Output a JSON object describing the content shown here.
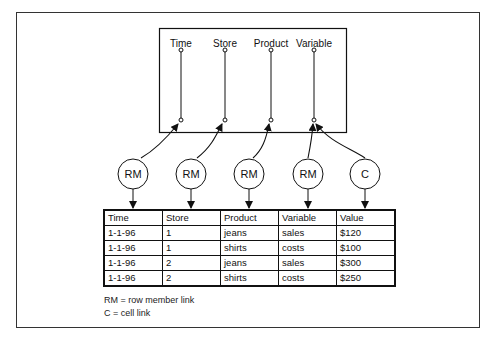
{
  "diagram": {
    "dimensions": [
      "Time",
      "Store",
      "Product",
      "Variable"
    ],
    "links": [
      {
        "label": "RM",
        "target_dimension": "Time",
        "target_column": "Time"
      },
      {
        "label": "RM",
        "target_dimension": "Store",
        "target_column": "Store"
      },
      {
        "label": "RM",
        "target_dimension": "Product",
        "target_column": "Product"
      },
      {
        "label": "RM",
        "target_dimension": "Variable",
        "target_column": "Variable"
      },
      {
        "label": "C",
        "target_dimension": "Variable",
        "target_column": "Value"
      }
    ],
    "table": {
      "headers": [
        "Time",
        "Store",
        "Product",
        "Variable",
        "Value"
      ],
      "rows": [
        [
          "1-1-96",
          "1",
          "jeans",
          "sales",
          "$120"
        ],
        [
          "1-1-96",
          "1",
          "shirts",
          "costs",
          "$100"
        ],
        [
          "1-1-96",
          "2",
          "jeans",
          "sales",
          "$300"
        ],
        [
          "1-1-96",
          "2",
          "shirts",
          "costs",
          "$250"
        ]
      ]
    },
    "legend": {
      "rm": "RM = row member link",
      "c": "C = cell link"
    }
  }
}
